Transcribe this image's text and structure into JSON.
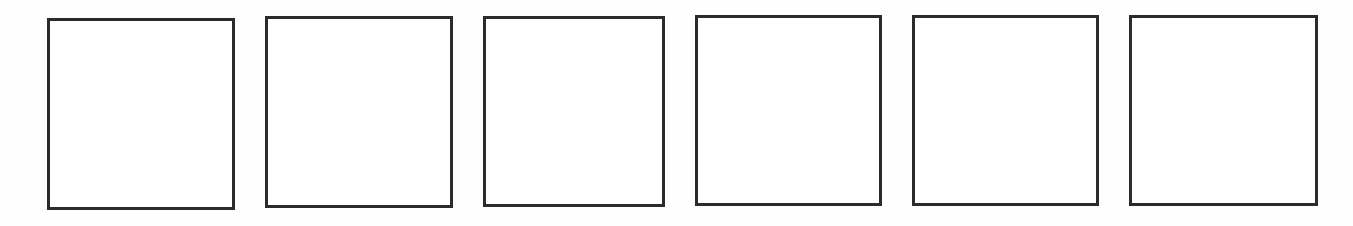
{
  "page": {
    "type": "worksheet-boxes",
    "border_color": "#2b2b2b",
    "background": "#ffffff"
  },
  "boxes": [
    {
      "index": 1,
      "label": "",
      "x": 47,
      "y": 18,
      "w": 188,
      "h": 192
    },
    {
      "index": 2,
      "label": "",
      "x": 265,
      "y": 16,
      "w": 188,
      "h": 192
    },
    {
      "index": 3,
      "label": "",
      "x": 483,
      "y": 16,
      "w": 182,
      "h": 191
    },
    {
      "index": 4,
      "label": "",
      "x": 695,
      "y": 15,
      "w": 187,
      "h": 191
    },
    {
      "index": 5,
      "label": "",
      "x": 912,
      "y": 15,
      "w": 187,
      "h": 191
    },
    {
      "index": 6,
      "label": "",
      "x": 1129,
      "y": 15,
      "w": 189,
      "h": 191
    }
  ]
}
